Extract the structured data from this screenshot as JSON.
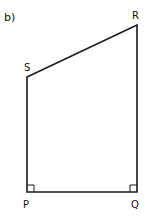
{
  "figure": {
    "part_label": "b)",
    "shape": "quadrilateral",
    "stroke_color": "#1a1a1a",
    "vertices": [
      {
        "name": "P",
        "label": "P",
        "right_angle": true
      },
      {
        "name": "Q",
        "label": "Q",
        "right_angle": true
      },
      {
        "name": "R",
        "label": "R",
        "right_angle": false
      },
      {
        "name": "S",
        "label": "S",
        "right_angle": false
      }
    ],
    "edges": [
      "PQ",
      "QR",
      "RS",
      "SP"
    ]
  }
}
